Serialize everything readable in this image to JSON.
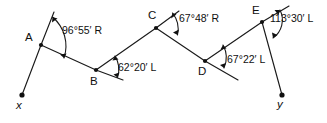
{
  "figure": {
    "type": "surveying-traverse-deflection-angle-diagram",
    "width": 327,
    "height": 123,
    "background_color": "#ffffff",
    "line_color": "#1a1a1a",
    "text_color": "#101010"
  },
  "stations": [
    {
      "id": "A",
      "label": "A",
      "x": 41,
      "y": 45,
      "label_x": 25,
      "label_y": 32
    },
    {
      "id": "B",
      "label": "B",
      "x": 96,
      "y": 70,
      "label_x": 90,
      "label_y": 76
    },
    {
      "id": "C",
      "label": "C",
      "x": 156,
      "y": 28,
      "label_x": 148,
      "label_y": 10
    },
    {
      "id": "D",
      "label": "D",
      "x": 205,
      "y": 61,
      "label_x": 198,
      "label_y": 66
    },
    {
      "id": "E",
      "label": "E",
      "x": 262,
      "y": 22,
      "label_x": 252,
      "label_y": 5
    }
  ],
  "terminals": [
    {
      "id": "x",
      "label": "x",
      "x": 22,
      "y": 95,
      "label_x": 16,
      "label_y": 100
    },
    {
      "id": "y",
      "label": "y",
      "x": 282,
      "y": 95,
      "label_x": 277,
      "label_y": 99
    }
  ],
  "angles": [
    {
      "at_station": "A",
      "value": "96°55′ R",
      "degrees": 96,
      "minutes": 55,
      "direction": "R",
      "direction_name": "right",
      "label_x": 62,
      "label_y": 25
    },
    {
      "at_station": "B",
      "value": "62°20′ L",
      "degrees": 62,
      "minutes": 20,
      "direction": "L",
      "direction_name": "left",
      "label_x": 118,
      "label_y": 62
    },
    {
      "at_station": "C",
      "value": "67°48′ R",
      "degrees": 67,
      "minutes": 48,
      "direction": "R",
      "direction_name": "right",
      "label_x": 179,
      "label_y": 13
    },
    {
      "at_station": "D",
      "value": "67°22′ L",
      "degrees": 67,
      "minutes": 22,
      "direction": "L",
      "direction_name": "left",
      "label_x": 227,
      "label_y": 54
    },
    {
      "at_station": "E",
      "value": "113°30′ L",
      "degrees": 113,
      "minutes": 30,
      "direction": "L",
      "direction_name": "left",
      "label_x": 270,
      "label_y": 13
    }
  ],
  "segments": [
    {
      "name": "x-A",
      "from": "x",
      "to": "A"
    },
    {
      "name": "A-B",
      "from": "A",
      "to": "B"
    },
    {
      "name": "B-C",
      "from": "B",
      "to": "C"
    },
    {
      "name": "C-D",
      "from": "C",
      "to": "D"
    },
    {
      "name": "D-E",
      "from": "D",
      "to": "E"
    },
    {
      "name": "E-y",
      "from": "E",
      "to": "y"
    }
  ],
  "tangent_extensions": [
    {
      "name": "tangent-at-A",
      "at_station": "A",
      "end_x": 54,
      "end_y": 12
    },
    {
      "name": "tangent-at-B",
      "at_station": "B",
      "end_x": 123,
      "end_y": 80
    },
    {
      "name": "tangent-at-C",
      "at_station": "C",
      "end_x": 179,
      "end_y": 11
    },
    {
      "name": "tangent-at-D",
      "at_station": "D",
      "end_x": 238,
      "end_y": 80
    },
    {
      "name": "tangent-at-E",
      "at_station": "E",
      "end_x": 289,
      "end_y": 6
    }
  ]
}
